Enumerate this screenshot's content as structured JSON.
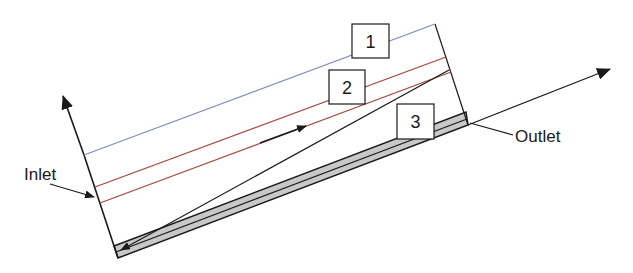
{
  "diagram": {
    "labels": {
      "inlet": "Inlet",
      "outlet": "Outlet"
    },
    "layer_markers": [
      {
        "id": 1,
        "text": "1"
      },
      {
        "id": 2,
        "text": "2"
      },
      {
        "id": 3,
        "text": "3"
      }
    ],
    "colors": {
      "layer_1_line": "#7a8fb8",
      "layer_2_lines": "#a5463c",
      "sediment_fill": "#c8c8c8",
      "stroke": "#1a1a1a"
    }
  }
}
